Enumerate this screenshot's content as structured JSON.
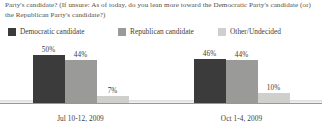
{
  "header": {
    "question": "Party's candidate? (If unsure: As of today, do you lean more toward the Democratic Party's candidate (or) the Republican Party's candidate?)"
  },
  "legend": {
    "items": [
      {
        "label": "Democratic candidate",
        "color": "#3b3b3b"
      },
      {
        "label": "Republican candidate",
        "color": "#9a9a98"
      },
      {
        "label": "Other/Undecided",
        "color": "#cfcfcd"
      }
    ]
  },
  "chart_data": {
    "type": "bar",
    "title": "",
    "subtitle": "",
    "xlabel": "",
    "ylabel": "",
    "ylim": [
      0,
      60
    ],
    "grid": false,
    "legend_position": "top",
    "categories": [
      "Jul 10-12, 2009",
      "Oct 1-4, 2009"
    ],
    "series": [
      {
        "name": "Democratic candidate",
        "color": "#3b3b3b",
        "values": [
          50,
          46
        ],
        "labels": [
          "50%",
          "44%"
        ]
      },
      {
        "name": "Republican candidate",
        "color": "#9a9a98",
        "values": [
          44,
          44
        ],
        "labels": [
          "44%",
          "44%"
        ]
      },
      {
        "name": "Other/Undecided",
        "color": "#cfcfcd",
        "values": [
          7,
          10
        ],
        "labels": [
          "7%",
          "10%"
        ]
      }
    ],
    "groups": [
      {
        "label": "Jul 10-12, 2009",
        "bars": [
          {
            "series": "Democratic candidate",
            "value": 50,
            "label": "50%",
            "color": "#3b3b3b"
          },
          {
            "series": "Republican candidate",
            "value": 44,
            "label": "44%",
            "color": "#9a9a98"
          },
          {
            "series": "Other/Undecided",
            "value": 7,
            "label": "7%",
            "color": "#cfcfcd"
          }
        ]
      },
      {
        "label": "Oct 1-4, 2009",
        "bars": [
          {
            "series": "Democratic candidate",
            "value": 46,
            "label": "46%",
            "color": "#3b3b3b"
          },
          {
            "series": "Republican candidate",
            "value": 44,
            "label": "44%",
            "color": "#9a9a98"
          },
          {
            "series": "Other/Undecided",
            "value": 10,
            "label": "10%",
            "color": "#cfcfcd"
          }
        ]
      }
    ]
  }
}
